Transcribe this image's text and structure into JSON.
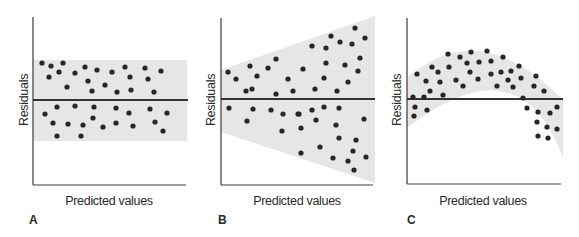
{
  "figure": {
    "band_color": "#e6e6e6",
    "dot_color": "#262626",
    "axis_color": "#3a3a3a",
    "zero_line_color": "#333333"
  },
  "chart_data": [
    {
      "panel": "A",
      "type": "scatter",
      "title": "",
      "xlabel": "Predicted values",
      "ylabel": "Residuals",
      "pattern": "constant variance band (homoscedastic)",
      "axes": {
        "x0": 33,
        "y_top": 17,
        "y_bottom": 185,
        "x_end": 186,
        "zero_y": 100
      },
      "band": {
        "shape": "rect",
        "points": [
          [
            33,
            60
          ],
          [
            187,
            60
          ],
          [
            187,
            141
          ],
          [
            33,
            141
          ]
        ]
      },
      "points": [
        [
          42,
          63
        ],
        [
          51,
          66
        ],
        [
          63,
          63
        ],
        [
          59,
          72
        ],
        [
          49,
          77
        ],
        [
          75,
          73
        ],
        [
          85,
          67
        ],
        [
          97,
          70
        ],
        [
          88,
          81
        ],
        [
          67,
          87
        ],
        [
          92,
          91
        ],
        [
          105,
          85
        ],
        [
          112,
          72
        ],
        [
          125,
          67
        ],
        [
          130,
          77
        ],
        [
          145,
          68
        ],
        [
          148,
          79
        ],
        [
          161,
          71
        ],
        [
          117,
          92
        ],
        [
          131,
          90
        ],
        [
          154,
          92
        ],
        [
          57,
          107
        ],
        [
          75,
          106
        ],
        [
          94,
          107
        ],
        [
          45,
          114
        ],
        [
          53,
          123
        ],
        [
          68,
          124
        ],
        [
          83,
          125
        ],
        [
          93,
          118
        ],
        [
          103,
          127
        ],
        [
          57,
          136
        ],
        [
          81,
          136
        ],
        [
          116,
          108
        ],
        [
          129,
          113
        ],
        [
          150,
          109
        ],
        [
          167,
          113
        ],
        [
          116,
          123
        ],
        [
          133,
          126
        ],
        [
          155,
          122
        ],
        [
          163,
          131
        ]
      ],
      "letter_pos": [
        29,
        224
      ],
      "xlabel_pos": [
        109,
        205
      ],
      "ylabel_pos": [
        24,
        100
      ]
    },
    {
      "panel": "B",
      "type": "scatter",
      "title": "",
      "xlabel": "Predicted values",
      "ylabel": "Residuals",
      "pattern": "fanning band (heteroscedastic)",
      "axes": {
        "x0": 221,
        "y_top": 18,
        "y_bottom": 185,
        "x_end": 373,
        "zero_y": 99
      },
      "band": {
        "shape": "polygon",
        "points": [
          [
            221,
            70
          ],
          [
            375,
            16
          ],
          [
            375,
            183
          ],
          [
            221,
            132
          ]
        ]
      },
      "points": [
        [
          228,
          72
        ],
        [
          236,
          79
        ],
        [
          250,
          66
        ],
        [
          257,
          76
        ],
        [
          268,
          68
        ],
        [
          276,
          59
        ],
        [
          246,
          91
        ],
        [
          252,
          89
        ],
        [
          288,
          79
        ],
        [
          276,
          94
        ],
        [
          293,
          91
        ],
        [
          229,
          108
        ],
        [
          253,
          109
        ],
        [
          271,
          110
        ],
        [
          283,
          114
        ],
        [
          247,
          121
        ],
        [
          282,
          131
        ],
        [
          298,
          114
        ],
        [
          303,
          69
        ],
        [
          312,
          46
        ],
        [
          326,
          48
        ],
        [
          331,
          36
        ],
        [
          340,
          42
        ],
        [
          352,
          44
        ],
        [
          355,
          28
        ],
        [
          365,
          38
        ],
        [
          326,
          63
        ],
        [
          345,
          65
        ],
        [
          360,
          58
        ],
        [
          358,
          71
        ],
        [
          324,
          78
        ],
        [
          348,
          82
        ],
        [
          315,
          89
        ],
        [
          337,
          91
        ],
        [
          299,
          114
        ],
        [
          312,
          110
        ],
        [
          324,
          107
        ],
        [
          339,
          108
        ],
        [
          316,
          120
        ],
        [
          336,
          125
        ],
        [
          364,
          119
        ],
        [
          301,
          128
        ],
        [
          339,
          138
        ],
        [
          356,
          140
        ],
        [
          320,
          147
        ],
        [
          353,
          151
        ],
        [
          301,
          153
        ],
        [
          333,
          158
        ],
        [
          348,
          161
        ],
        [
          366,
          157
        ],
        [
          354,
          170
        ]
      ],
      "letter_pos": [
        218,
        224
      ],
      "xlabel_pos": [
        297,
        205
      ],
      "ylabel_pos": [
        211,
        100
      ]
    },
    {
      "panel": "C",
      "type": "scatter",
      "title": "",
      "xlabel": "Predicted values",
      "ylabel": "Residuals",
      "pattern": "curved (inverted-U) band — nonlinearity",
      "axes": {
        "x0": 407,
        "y_top": 18,
        "y_bottom": 184,
        "x_end": 561,
        "zero_y": 99
      },
      "band": {
        "shape": "path",
        "d": "M407,78 Q480,14 563,100 L563,158 Q520,40 407,128 Z"
      },
      "points": [
        [
          417,
          74
        ],
        [
          426,
          81
        ],
        [
          432,
          67
        ],
        [
          438,
          72
        ],
        [
          440,
          82
        ],
        [
          430,
          91
        ],
        [
          448,
          54
        ],
        [
          449,
          67
        ],
        [
          456,
          80
        ],
        [
          460,
          57
        ],
        [
          463,
          86
        ],
        [
          467,
          63
        ],
        [
          470,
          72
        ],
        [
          471,
          52
        ],
        [
          479,
          62
        ],
        [
          478,
          79
        ],
        [
          487,
          51
        ],
        [
          491,
          61
        ],
        [
          503,
          57
        ],
        [
          491,
          74
        ],
        [
          501,
          72
        ],
        [
          511,
          71
        ],
        [
          508,
          80
        ],
        [
          519,
          66
        ],
        [
          497,
          86
        ],
        [
          513,
          87
        ],
        [
          521,
          78
        ],
        [
          536,
          76
        ],
        [
          534,
          86
        ],
        [
          544,
          91
        ],
        [
          413,
          97
        ],
        [
          424,
          97
        ],
        [
          443,
          95
        ],
        [
          523,
          98
        ],
        [
          415,
          107
        ],
        [
          414,
          116
        ],
        [
          427,
          110
        ],
        [
          527,
          108
        ],
        [
          538,
          112
        ],
        [
          550,
          113
        ],
        [
          557,
          107
        ],
        [
          537,
          122
        ],
        [
          547,
          127
        ],
        [
          557,
          129
        ],
        [
          538,
          136
        ],
        [
          548,
          138
        ]
      ],
      "letter_pos": [
        407,
        224
      ],
      "xlabel_pos": [
        483,
        205
      ],
      "ylabel_pos": [
        397,
        100
      ]
    }
  ]
}
